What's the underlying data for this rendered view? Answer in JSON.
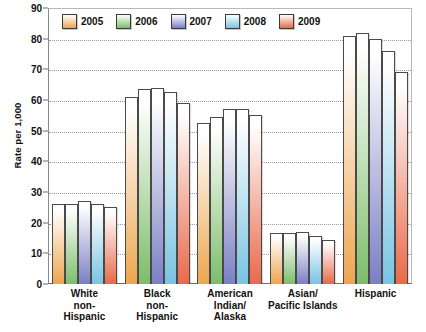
{
  "chart_data": {
    "type": "bar",
    "title": "",
    "xlabel": "",
    "ylabel": "Rate per 1,000",
    "ylim": [
      0,
      90
    ],
    "ytick_step": 10,
    "yticks": [
      0,
      10,
      20,
      30,
      40,
      50,
      60,
      70,
      80,
      90
    ],
    "grid": true,
    "legend_position": "top-left inside plot",
    "categories": [
      "White non-Hispanic",
      "Black non-Hispanic",
      "American Indian/Alaska",
      "Asian/Pacific Islands",
      "Hispanic"
    ],
    "category_lines": [
      [
        "White",
        "non-",
        "Hispanic"
      ],
      [
        "Black",
        "non-",
        "Hispanic"
      ],
      [
        "American",
        "Indian/",
        "Alaska"
      ],
      [
        "Asian/",
        "Pacific Islands"
      ],
      [
        "Hispanic"
      ]
    ],
    "series": [
      {
        "name": "2005",
        "color": "#eda64f",
        "values": [
          26,
          61,
          52.5,
          16.5,
          81
        ]
      },
      {
        "name": "2006",
        "color": "#7dbd6a",
        "values": [
          26,
          63.5,
          54.5,
          16.5,
          82
        ]
      },
      {
        "name": "2007",
        "color": "#7b7fc4",
        "values": [
          27,
          64,
          57,
          17,
          80
        ]
      },
      {
        "name": "2008",
        "color": "#79c3e3",
        "values": [
          26,
          62.5,
          57,
          15.5,
          76
        ]
      },
      {
        "name": "2009",
        "color": "#e8694a",
        "values": [
          25,
          59,
          55,
          14.5,
          69
        ]
      }
    ]
  },
  "legend": {
    "items": [
      {
        "label": "2005",
        "color": "#eda64f"
      },
      {
        "label": "2006",
        "color": "#7dbd6a"
      },
      {
        "label": "2007",
        "color": "#7b7fc4"
      },
      {
        "label": "2008",
        "color": "#79c3e3"
      },
      {
        "label": "2009",
        "color": "#e8694a"
      }
    ]
  },
  "axes": {
    "y_title": "Rate per 1,000",
    "y_labels": [
      "90",
      "80",
      "70",
      "60",
      "50",
      "40",
      "30",
      "20",
      "10",
      "0"
    ]
  }
}
